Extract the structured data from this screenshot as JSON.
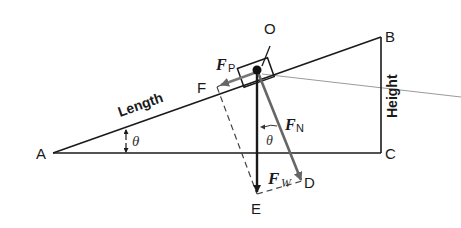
{
  "diagram": {
    "points": {
      "A": "A",
      "B": "B",
      "C": "C",
      "D": "D",
      "E": "E",
      "F": "F",
      "O": "O"
    },
    "side_labels": {
      "length": "Length",
      "height": "Height"
    },
    "angle_labels": {
      "base_angle": "θ",
      "force_angle": "θ"
    },
    "forces": {
      "parallel": {
        "symbol": "F",
        "subscript": "P"
      },
      "normal": {
        "symbol": "F",
        "subscript": "N"
      },
      "weight": {
        "symbol": "F",
        "subscript": "W"
      }
    },
    "colors": {
      "line": "#1a1a1a",
      "force_vector": "#555555",
      "guide_line": "#9a9a9a",
      "dashed": "#444444"
    }
  }
}
